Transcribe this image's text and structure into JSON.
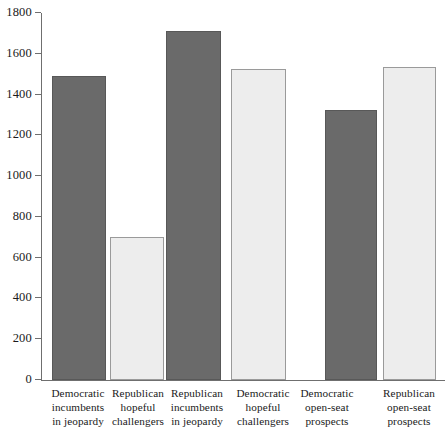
{
  "chart_data": {
    "type": "bar",
    "title": "",
    "subtitle": "",
    "xlabel": "",
    "ylabel": "",
    "ylim": [
      0,
      1800
    ],
    "ytick_step": 200,
    "grid": false,
    "legend": "none",
    "categories": [
      "Democratic\nincumbents\nin jeopardy",
      "Republican\nhopeful\nchallengers",
      "Republican\nincumbents\nin jeopardy",
      "Democratic\nhopeful\nchallengers",
      "Democratic\nopen-seat\nprospects",
      "Republican\nopen-seat\nprospects"
    ],
    "values": [
      1490,
      700,
      1710,
      1525,
      1325,
      1535
    ],
    "bar_styles": [
      "dark",
      "light",
      "dark",
      "light",
      "dark",
      "light"
    ],
    "ytick_labels": [
      "1800",
      "1600",
      "1400",
      "1200",
      "1000",
      "800",
      "600",
      "400",
      "200",
      "0"
    ],
    "ytick_values": [
      1800,
      1600,
      1400,
      1200,
      1000,
      800,
      600,
      400,
      200,
      0
    ],
    "colors": {
      "dark_bar": "#6a6a6a",
      "dark_bar_border": "#585858",
      "light_bar": "#ededed",
      "light_bar_border": "#9a9a9a",
      "axis": "#6f6f6f",
      "text": "#1a1a1a",
      "background": "#ffffff"
    },
    "bar_geometry": [
      {
        "left": 11,
        "width": 54
      },
      {
        "left": 69,
        "width": 54
      },
      {
        "left": 125,
        "width": 55
      },
      {
        "left": 190,
        "width": 55
      },
      {
        "left": 284,
        "width": 52
      },
      {
        "left": 342,
        "width": 53
      }
    ],
    "label_geometry": [
      {
        "left": 44,
        "width": 68
      },
      {
        "left": 104,
        "width": 68
      },
      {
        "left": 162,
        "width": 70
      },
      {
        "left": 228,
        "width": 70
      },
      {
        "left": 292,
        "width": 70
      },
      {
        "left": 374,
        "width": 70
      }
    ]
  }
}
